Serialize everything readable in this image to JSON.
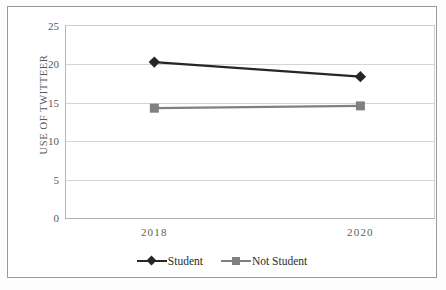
{
  "chart_data": {
    "type": "line",
    "title": "",
    "xlabel": "",
    "ylabel": "USE OF TWITTEER",
    "categories": [
      "2018",
      "2020"
    ],
    "x_tick_labels": [
      "2018",
      "2020"
    ],
    "y_tick_labels": [
      "0",
      "5",
      "10",
      "15",
      "20",
      "25"
    ],
    "y_ticks": [
      0,
      5,
      10,
      15,
      20,
      25
    ],
    "ylim": [
      0,
      25
    ],
    "grid": "horizontal",
    "legend_position": "bottom-center",
    "series": [
      {
        "name": "Student",
        "values": [
          20.3,
          18.4
        ],
        "color": "#262626",
        "marker": "diamond"
      },
      {
        "name": "Not Student",
        "values": [
          14.3,
          14.6
        ],
        "color": "#808080",
        "marker": "square"
      }
    ]
  },
  "legend": {
    "items": [
      {
        "label": "Student"
      },
      {
        "label": "Not Student"
      }
    ]
  }
}
